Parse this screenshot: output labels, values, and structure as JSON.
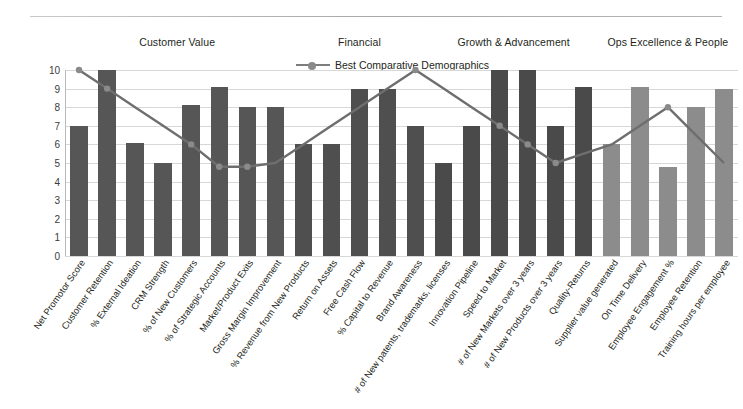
{
  "chart_data": {
    "type": "bar",
    "title": "",
    "subtitle": "",
    "xlabel": "",
    "ylabel": "",
    "ylim": [
      0,
      10
    ],
    "yticks": [
      10,
      9,
      8,
      7,
      6,
      5,
      4,
      3,
      2,
      1,
      0
    ],
    "grid": true,
    "legend_position": "top-center",
    "legend": [
      "Best Comparative Demographics"
    ],
    "categories": [
      "Net Promotor Score",
      "Customer Retention",
      "% External Ideation",
      "CRM Strength",
      "% of New Customers",
      "% of Strategic Accounts",
      "Market/Product Exits",
      "Gross Margin Improvement",
      "% Revenue from New Products",
      "Return on Assets",
      "Free Cash Flow",
      "% Capital to Revenue",
      "Brand Awareness",
      "# of New patents, trademarks, licenses",
      "Innovation Pipeline",
      "Speed to Market",
      "# of New Markets over 3 years",
      "# of New Products over 3 years",
      "Quality-Returns",
      "Supplier value generated",
      "On Time Delivery",
      "Employee Engagement %",
      "Employee Retention",
      "Training hours per employee"
    ],
    "series": [
      {
        "name": "Score",
        "type": "bar",
        "values": [
          7.0,
          10.2,
          6.1,
          5.0,
          8.1,
          9.1,
          8.0,
          8.0,
          6.0,
          6.0,
          9.0,
          9.0,
          7.0,
          5.0,
          7.0,
          10.2,
          10.2,
          7.0,
          9.1,
          6.0,
          9.1,
          4.8,
          8.0,
          9.0
        ]
      },
      {
        "name": "Best Comparative Demographics",
        "type": "line",
        "values": [
          10.0,
          9.0,
          8.0,
          7.0,
          6.0,
          4.8,
          4.8,
          5.0,
          6.0,
          7.0,
          8.0,
          9.0,
          10.0,
          9.0,
          8.0,
          7.0,
          6.0,
          5.0,
          5.5,
          6.0,
          7.0,
          8.0,
          6.5,
          5.0
        ]
      }
    ],
    "bar_colors_by_section": [
      "#565656",
      "#4f4f4f",
      "#4a4a4a",
      "#8c8c8c"
    ],
    "line_color": "#6e6e6e",
    "grid_color": "#d7d7d7"
  },
  "sections": [
    {
      "label": "Customer Value",
      "start_index": 0,
      "end_index": 7
    },
    {
      "label": "Financial",
      "start_index": 8,
      "end_index": 12
    },
    {
      "label": "Growth & Advancement",
      "start_index": 13,
      "end_index": 18
    },
    {
      "label": "Ops Excellence & People",
      "start_index": 19,
      "end_index": 23
    }
  ],
  "legend_item": {
    "label": "Best Comparative Demographics",
    "marker": "line-with-marker-icon"
  }
}
